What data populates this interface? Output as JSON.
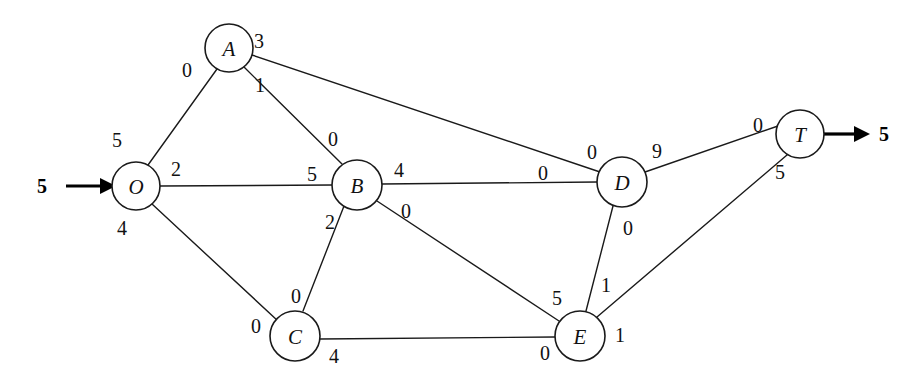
{
  "diagram": {
    "type": "flow-network",
    "canvas": {
      "width": 913,
      "height": 388
    },
    "colors": {
      "stroke": "#1a1a1a",
      "background": "#ffffff",
      "text": "#111111"
    },
    "nodes": [
      {
        "id": "O",
        "label": "O",
        "cx": 136,
        "cy": 186,
        "r": 24
      },
      {
        "id": "A",
        "label": "A",
        "cx": 229,
        "cy": 48,
        "r": 24
      },
      {
        "id": "B",
        "label": "B",
        "cx": 357,
        "cy": 185,
        "r": 25
      },
      {
        "id": "C",
        "label": "C",
        "cx": 295,
        "cy": 336,
        "r": 25
      },
      {
        "id": "D",
        "label": "D",
        "cx": 622,
        "cy": 182,
        "r": 25
      },
      {
        "id": "E",
        "label": "E",
        "cx": 580,
        "cy": 336,
        "r": 25
      },
      {
        "id": "T",
        "label": "T",
        "cx": 800,
        "cy": 134,
        "r": 24
      }
    ],
    "edges": [
      {
        "id": "O-A",
        "from": "O",
        "to": "A",
        "x1": 148,
        "y1": 165,
        "x2": 217,
        "y2": 69
      },
      {
        "id": "A-D",
        "from": "A",
        "to": "D",
        "x1": 252,
        "y1": 55,
        "x2": 600,
        "y2": 172
      },
      {
        "id": "A-B",
        "from": "A",
        "to": "B",
        "x1": 244,
        "y1": 67,
        "x2": 342,
        "y2": 164
      },
      {
        "id": "O-B",
        "from": "O",
        "to": "B",
        "x1": 160,
        "y1": 186,
        "x2": 332,
        "y2": 185
      },
      {
        "id": "O-C",
        "from": "O",
        "to": "C",
        "x1": 152,
        "y1": 204,
        "x2": 278,
        "y2": 321
      },
      {
        "id": "B-D",
        "from": "B",
        "to": "D",
        "x1": 382,
        "y1": 184,
        "x2": 597,
        "y2": 182
      },
      {
        "id": "B-C",
        "from": "B",
        "to": "C",
        "x1": 344,
        "y1": 206,
        "x2": 303,
        "y2": 311
      },
      {
        "id": "B-E",
        "from": "B",
        "to": "E",
        "x1": 377,
        "y1": 201,
        "x2": 559,
        "y2": 321
      },
      {
        "id": "C-E",
        "from": "C",
        "to": "E",
        "x1": 320,
        "y1": 339,
        "x2": 555,
        "y2": 337
      },
      {
        "id": "D-E",
        "from": "D",
        "to": "E",
        "x1": 613,
        "y1": 206,
        "x2": 586,
        "y2": 311
      },
      {
        "id": "D-T",
        "from": "D",
        "to": "T",
        "x1": 645,
        "y1": 172,
        "x2": 778,
        "y2": 126
      },
      {
        "id": "E-T",
        "from": "E",
        "to": "T",
        "x1": 597,
        "y1": 317,
        "x2": 787,
        "y2": 155
      }
    ],
    "flow_labels": [
      {
        "id": "O-A-at-A",
        "value": "0",
        "x": 187,
        "y": 70,
        "edge": "O-A",
        "endpoint": "A-side"
      },
      {
        "id": "O-A-at-O",
        "value": "5",
        "x": 117,
        "y": 140,
        "edge": "O-A",
        "endpoint": "O-side"
      },
      {
        "id": "A-D-at-A",
        "value": "3",
        "x": 259,
        "y": 41,
        "edge": "A-D",
        "endpoint": "A-side"
      },
      {
        "id": "A-B-at-A",
        "value": "1",
        "x": 260,
        "y": 85,
        "edge": "A-B",
        "endpoint": "A-side"
      },
      {
        "id": "A-B-at-B",
        "value": "0",
        "x": 333,
        "y": 139,
        "edge": "A-B",
        "endpoint": "B-side"
      },
      {
        "id": "O-B-at-O",
        "value": "2",
        "x": 176,
        "y": 169,
        "edge": "O-B",
        "endpoint": "O-side"
      },
      {
        "id": "O-B-at-B",
        "value": "5",
        "x": 312,
        "y": 174,
        "edge": "O-B",
        "endpoint": "B-side"
      },
      {
        "id": "O-C-at-O",
        "value": "4",
        "x": 122,
        "y": 228,
        "edge": "O-C",
        "endpoint": "O-side"
      },
      {
        "id": "O-C-at-C",
        "value": "0",
        "x": 256,
        "y": 326,
        "edge": "O-C",
        "endpoint": "C-side"
      },
      {
        "id": "B-D-at-B",
        "value": "4",
        "x": 399,
        "y": 170,
        "edge": "B-D",
        "endpoint": "B-side"
      },
      {
        "id": "B-D-at-D",
        "value": "0",
        "x": 543,
        "y": 173,
        "edge": "B-D",
        "endpoint": "D-side"
      },
      {
        "id": "A-D-at-D",
        "value": "0",
        "x": 592,
        "y": 152,
        "edge": "A-D",
        "endpoint": "D-side"
      },
      {
        "id": "B-C-at-B",
        "value": "2",
        "x": 330,
        "y": 222,
        "edge": "B-C",
        "endpoint": "B-side"
      },
      {
        "id": "B-C-at-C",
        "value": "0",
        "x": 296,
        "y": 296,
        "edge": "B-C",
        "endpoint": "C-side"
      },
      {
        "id": "B-E-at-B",
        "value": "0",
        "x": 406,
        "y": 211,
        "edge": "B-E",
        "endpoint": "B-side"
      },
      {
        "id": "B-E-at-E",
        "value": "5",
        "x": 557,
        "y": 298,
        "edge": "B-E",
        "endpoint": "E-side"
      },
      {
        "id": "C-E-at-C",
        "value": "4",
        "x": 334,
        "y": 356,
        "edge": "C-E",
        "endpoint": "C-side"
      },
      {
        "id": "C-E-at-E",
        "value": "0",
        "x": 545,
        "y": 353,
        "edge": "C-E",
        "endpoint": "E-side"
      },
      {
        "id": "D-E-at-D",
        "value": "0",
        "x": 628,
        "y": 228,
        "edge": "D-E",
        "endpoint": "D-side"
      },
      {
        "id": "D-E-at-E",
        "value": "1",
        "x": 606,
        "y": 285,
        "edge": "D-E",
        "endpoint": "E-side"
      },
      {
        "id": "D-T-at-D",
        "value": "9",
        "x": 657,
        "y": 151,
        "edge": "D-T",
        "endpoint": "D-side"
      },
      {
        "id": "D-T-at-T",
        "value": "0",
        "x": 758,
        "y": 125,
        "edge": "D-T",
        "endpoint": "T-side"
      },
      {
        "id": "E-T-at-T",
        "value": "5",
        "x": 780,
        "y": 172,
        "edge": "E-T",
        "endpoint": "T-side"
      },
      {
        "id": "E-T-at-E",
        "value": "1",
        "x": 620,
        "y": 335,
        "edge": "E-T",
        "endpoint": "E-side"
      }
    ],
    "terminals": [
      {
        "id": "source-inflow",
        "label": "5",
        "label_x": 42,
        "label_y": 186,
        "shaft_x1": 66,
        "shaft_x2": 100,
        "shaft_y": 186,
        "head_points": "100,178 116,186 100,194"
      },
      {
        "id": "sink-outflow",
        "label": "5",
        "label_x": 884,
        "label_y": 134,
        "shaft_x1": 824,
        "shaft_x2": 854,
        "shaft_y": 134,
        "head_points": "854,126 870,134 854,142"
      }
    ]
  }
}
